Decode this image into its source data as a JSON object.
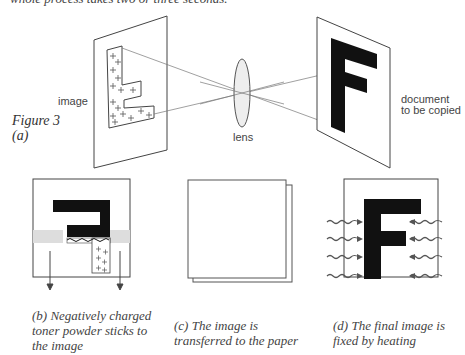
{
  "top_text": "whole process takes two or three seconds.",
  "figure": {
    "label_line1": "Figure 3",
    "label_line2": "(a)",
    "image_label": "image",
    "lens_label": "lens",
    "document_label_line1": "document",
    "document_label_line2": "to be copied"
  },
  "panels": [
    {
      "id": "b",
      "caption_line1": "(b)  Negatively charged",
      "caption_line2": "toner powder sticks to",
      "caption_line3": "the image"
    },
    {
      "id": "c",
      "caption_line1": "(c)  The image is",
      "caption_line2": "transferred to the paper"
    },
    {
      "id": "d",
      "caption_line1": "(d)  The final image is",
      "caption_line2": "fixed by heating"
    }
  ],
  "colors": {
    "ink": "#111111",
    "line": "#555555",
    "lens_fill": "#eeeeee",
    "toner": "#bbbbbb"
  }
}
